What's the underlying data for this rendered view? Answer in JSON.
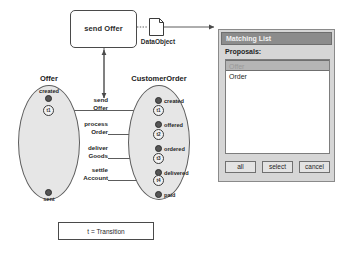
{
  "activity": {
    "label": "send Offer",
    "icon": "rounded-rectangle"
  },
  "data_object": {
    "label": "DataObject",
    "icon": "document-note-icon"
  },
  "legend": {
    "text": "t  = Transition"
  },
  "lifecycles": [
    {
      "title": "Offer",
      "states": [
        {
          "label": "created"
        },
        {
          "label": "sent"
        }
      ],
      "transitions": [
        {
          "label": "t1"
        }
      ]
    },
    {
      "title": "CustomerOrder",
      "states": [
        {
          "label": "created"
        },
        {
          "label": "offered"
        },
        {
          "label": "ordered"
        },
        {
          "label": "delivered"
        },
        {
          "label": "paid"
        }
      ],
      "transitions": [
        {
          "label": "t1"
        },
        {
          "label": "t2"
        },
        {
          "label": "t3"
        },
        {
          "label": "t4"
        }
      ]
    }
  ],
  "transition_names": [
    {
      "line1": "send",
      "line2": "Offer"
    },
    {
      "line1": "process",
      "line2": "Order"
    },
    {
      "line1": "deliver",
      "line2": "Goods"
    },
    {
      "line1": "settle",
      "line2": "Account"
    }
  ],
  "dialog": {
    "title": "Matching List",
    "proposals_label": "Proposals:",
    "items": [
      {
        "label": "Offer",
        "selected": true
      },
      {
        "label": "Order",
        "selected": false
      }
    ],
    "buttons": [
      {
        "label": "all"
      },
      {
        "label": "select"
      },
      {
        "label": "cancel"
      }
    ]
  },
  "colors": {
    "ellipse_fill": "#e6e6e6",
    "titlebar": "#8c8c8c",
    "dialog_face": "#d6d6d6",
    "selection": "#b5b5b5",
    "node": "#555555"
  }
}
